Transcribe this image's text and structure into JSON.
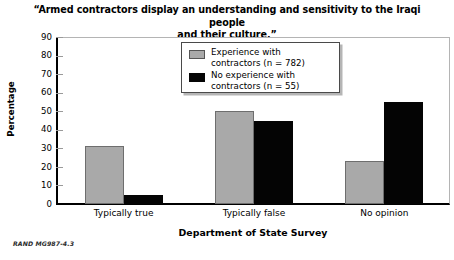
{
  "chart_data": {
    "type": "bar",
    "title": "“Armed contractors display an understanding and sensitivity to the Iraqi people and their culture.”",
    "title_line1": "“Armed contractors display an understanding and sensitivity to the Iraqi people",
    "title_line2": "and their culture.”",
    "xlabel": "Department of State Survey",
    "ylabel": "Percentage",
    "categories": [
      "Typically true",
      "Typically false",
      "No opinion"
    ],
    "series": [
      {
        "name": "Experience with contractors (n = 782)",
        "name_line1": "Experience with",
        "name_line2": "contractors (n = 782)",
        "color": "#a9a9a9",
        "values": [
          31,
          50,
          23
        ]
      },
      {
        "name": "No experience with contractors (n = 55)",
        "name_line1": "No experience with",
        "name_line2": "contractors (n = 55)",
        "color": "#050505",
        "values": [
          5,
          45,
          55
        ]
      }
    ],
    "ylim": [
      0,
      90
    ],
    "yticks": [
      0,
      10,
      20,
      30,
      40,
      50,
      60,
      70,
      80,
      90
    ],
    "ytick_labels": [
      "0",
      "10",
      "20",
      "30",
      "40",
      "50",
      "60",
      "70",
      "80",
      "90"
    ],
    "grid": false,
    "legend_position": "upper center"
  },
  "source_note": "RAND MG987-4.3"
}
